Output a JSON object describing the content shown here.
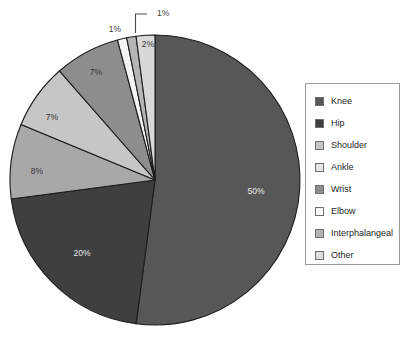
{
  "chart_data": {
    "type": "pie",
    "title": "",
    "subtitle": "",
    "xlabel": "",
    "ylabel": "",
    "grid": false,
    "legend_position": "right",
    "start_angle_deg": 0,
    "direction": "clockwise",
    "categories": [
      "Knee",
      "Hip",
      "Shoulder",
      "Ankle",
      "Wrist",
      "Elbow",
      "Interphalangeal",
      "Other"
    ],
    "values": [
      50,
      20,
      7,
      8,
      7,
      1,
      1,
      2
    ],
    "value_labels": [
      "50%",
      "20%",
      "7%",
      "8%",
      "7%",
      "1%",
      "1%",
      "2%"
    ],
    "slice_order_clockwise": [
      "Knee",
      "Hip",
      "Ankle",
      "Shoulder",
      "Wrist",
      "Elbow",
      "Interphalangeal",
      "Other"
    ],
    "colors": {
      "Knee": "#575757",
      "Hip": "#3f3f3f",
      "Shoulder": "#c6c6c6",
      "Ankle": "#a8a8a8",
      "Wrist": "#8d8d8d",
      "Elbow": "#f4f4f4",
      "Interphalangeal": "#b5b5b5",
      "Other": "#d8d8d8"
    },
    "slice_border_color": "#1c1c1c",
    "labels_inside": [
      {
        "text": "50%",
        "color": "#e8e8e8"
      },
      {
        "text": "20%",
        "color": "#e8e8e8"
      },
      {
        "text": "8%",
        "color": "#333333"
      },
      {
        "text": "7%",
        "color": "#333333"
      },
      {
        "text": "7%",
        "color": "#333333"
      },
      {
        "text": "2%",
        "color": "#333333"
      }
    ],
    "labels_outside": [
      {
        "text": "1%",
        "leader": false
      },
      {
        "text": "1%",
        "leader": true
      }
    ]
  },
  "legend": {
    "items": [
      {
        "label": "Knee",
        "color": "#575757"
      },
      {
        "label": "Hip",
        "color": "#3f3f3f"
      },
      {
        "label": "Shoulder",
        "color": "#c6c6c6"
      },
      {
        "label": "Ankle",
        "color": "#e4e4e4"
      },
      {
        "label": "Wrist",
        "color": "#8d8d8d"
      },
      {
        "label": "Elbow",
        "color": "#fbfbfb"
      },
      {
        "label": "Interphalangeal",
        "color": "#b5b5b5"
      },
      {
        "label": "Other",
        "color": "#dedede"
      }
    ]
  },
  "pie_labels": {
    "knee": "50%",
    "hip": "20%",
    "ankle": "8%",
    "shoulder": "7%",
    "wrist": "7%",
    "elbow": "1%",
    "interphalangeal": "1%",
    "other": "2%"
  }
}
